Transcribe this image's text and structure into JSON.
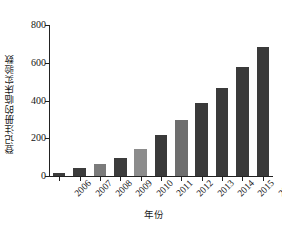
{
  "chart_data": {
    "type": "bar",
    "title": "",
    "xlabel": "年份",
    "ylabel": "登记注册的临床实验数",
    "categories": [
      "2006",
      "2007",
      "2008",
      "2009",
      "2010",
      "2011",
      "2012",
      "2013",
      "2014",
      "2015",
      "2016"
    ],
    "values": [
      15,
      40,
      65,
      95,
      145,
      215,
      295,
      385,
      465,
      575,
      685
    ],
    "series": [
      {
        "name": "登记注册的临床实验数",
        "values": [
          15,
          40,
          65,
          95,
          145,
          215,
          295,
          385,
          465,
          575,
          685
        ]
      }
    ],
    "ylim": [
      0,
      800
    ],
    "yticks": [
      0,
      200,
      400,
      600,
      800
    ],
    "ytick_labels": [
      "0",
      "200",
      "400",
      "600",
      "800"
    ],
    "grid": false,
    "legend": false,
    "legend_position": "none",
    "bar_colors": [
      "#3c3c3c",
      "#3c3c3c",
      "#7b7b7b",
      "#3c3c3c",
      "#8c8c8c",
      "#3a3a3a",
      "#6e6e6e",
      "#3a3a3a",
      "#3a3a3a",
      "#3a3a3a",
      "#3a3a3a"
    ],
    "accent_color": "#3a3a3a",
    "secondary_color": "#7b7b7b",
    "axis_color": "#222222",
    "background_color": "#ffffff"
  },
  "axis": {
    "y_title": "登记注册的临床实验数",
    "x_title": "年份"
  }
}
